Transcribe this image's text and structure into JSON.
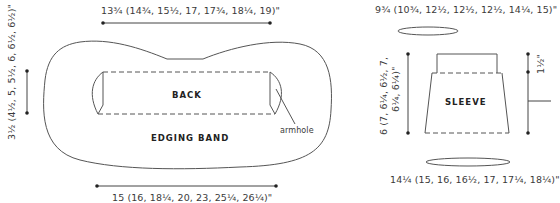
{
  "back_diagram": {
    "top_width_label": "13¾ (14¾, 15½, 17, 17¾, 18¼, 19)\"",
    "side_height_label": "3½ (4½, 5, 5½, 6, 6½, 6½)\"",
    "bottom_width_label": "15 (16, 18¼, 20, 23, 25¼, 26¼)\"",
    "back_label": "BACK",
    "edging_label": "EDGING BAND",
    "armhole_label": "armhole"
  },
  "sleeve_diagram": {
    "top_circumference_label": "9¾ (10¾, 12½, 12½, 12½, 14¼, 15)\"",
    "length_label_line1": "6 (7, 6¼, 6½, 7,",
    "length_label_line2": "6¼, 6¼)\"",
    "cuff_label": "1½\"",
    "sleeve_label": "SLEEVE",
    "bottom_circumference_label": "14¼ (15, 16, 16½, 17, 17¼, 18¼)\""
  },
  "colors": {
    "line": "#555555",
    "text": "#3a3a3a"
  }
}
